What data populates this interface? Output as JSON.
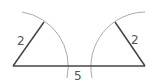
{
  "diagram": {
    "labels": {
      "left_side": "2",
      "right_side": "2",
      "base": "5"
    },
    "colors": {
      "segment": "#444444",
      "arc": "#aaaaaa",
      "text": "#555555"
    }
  }
}
